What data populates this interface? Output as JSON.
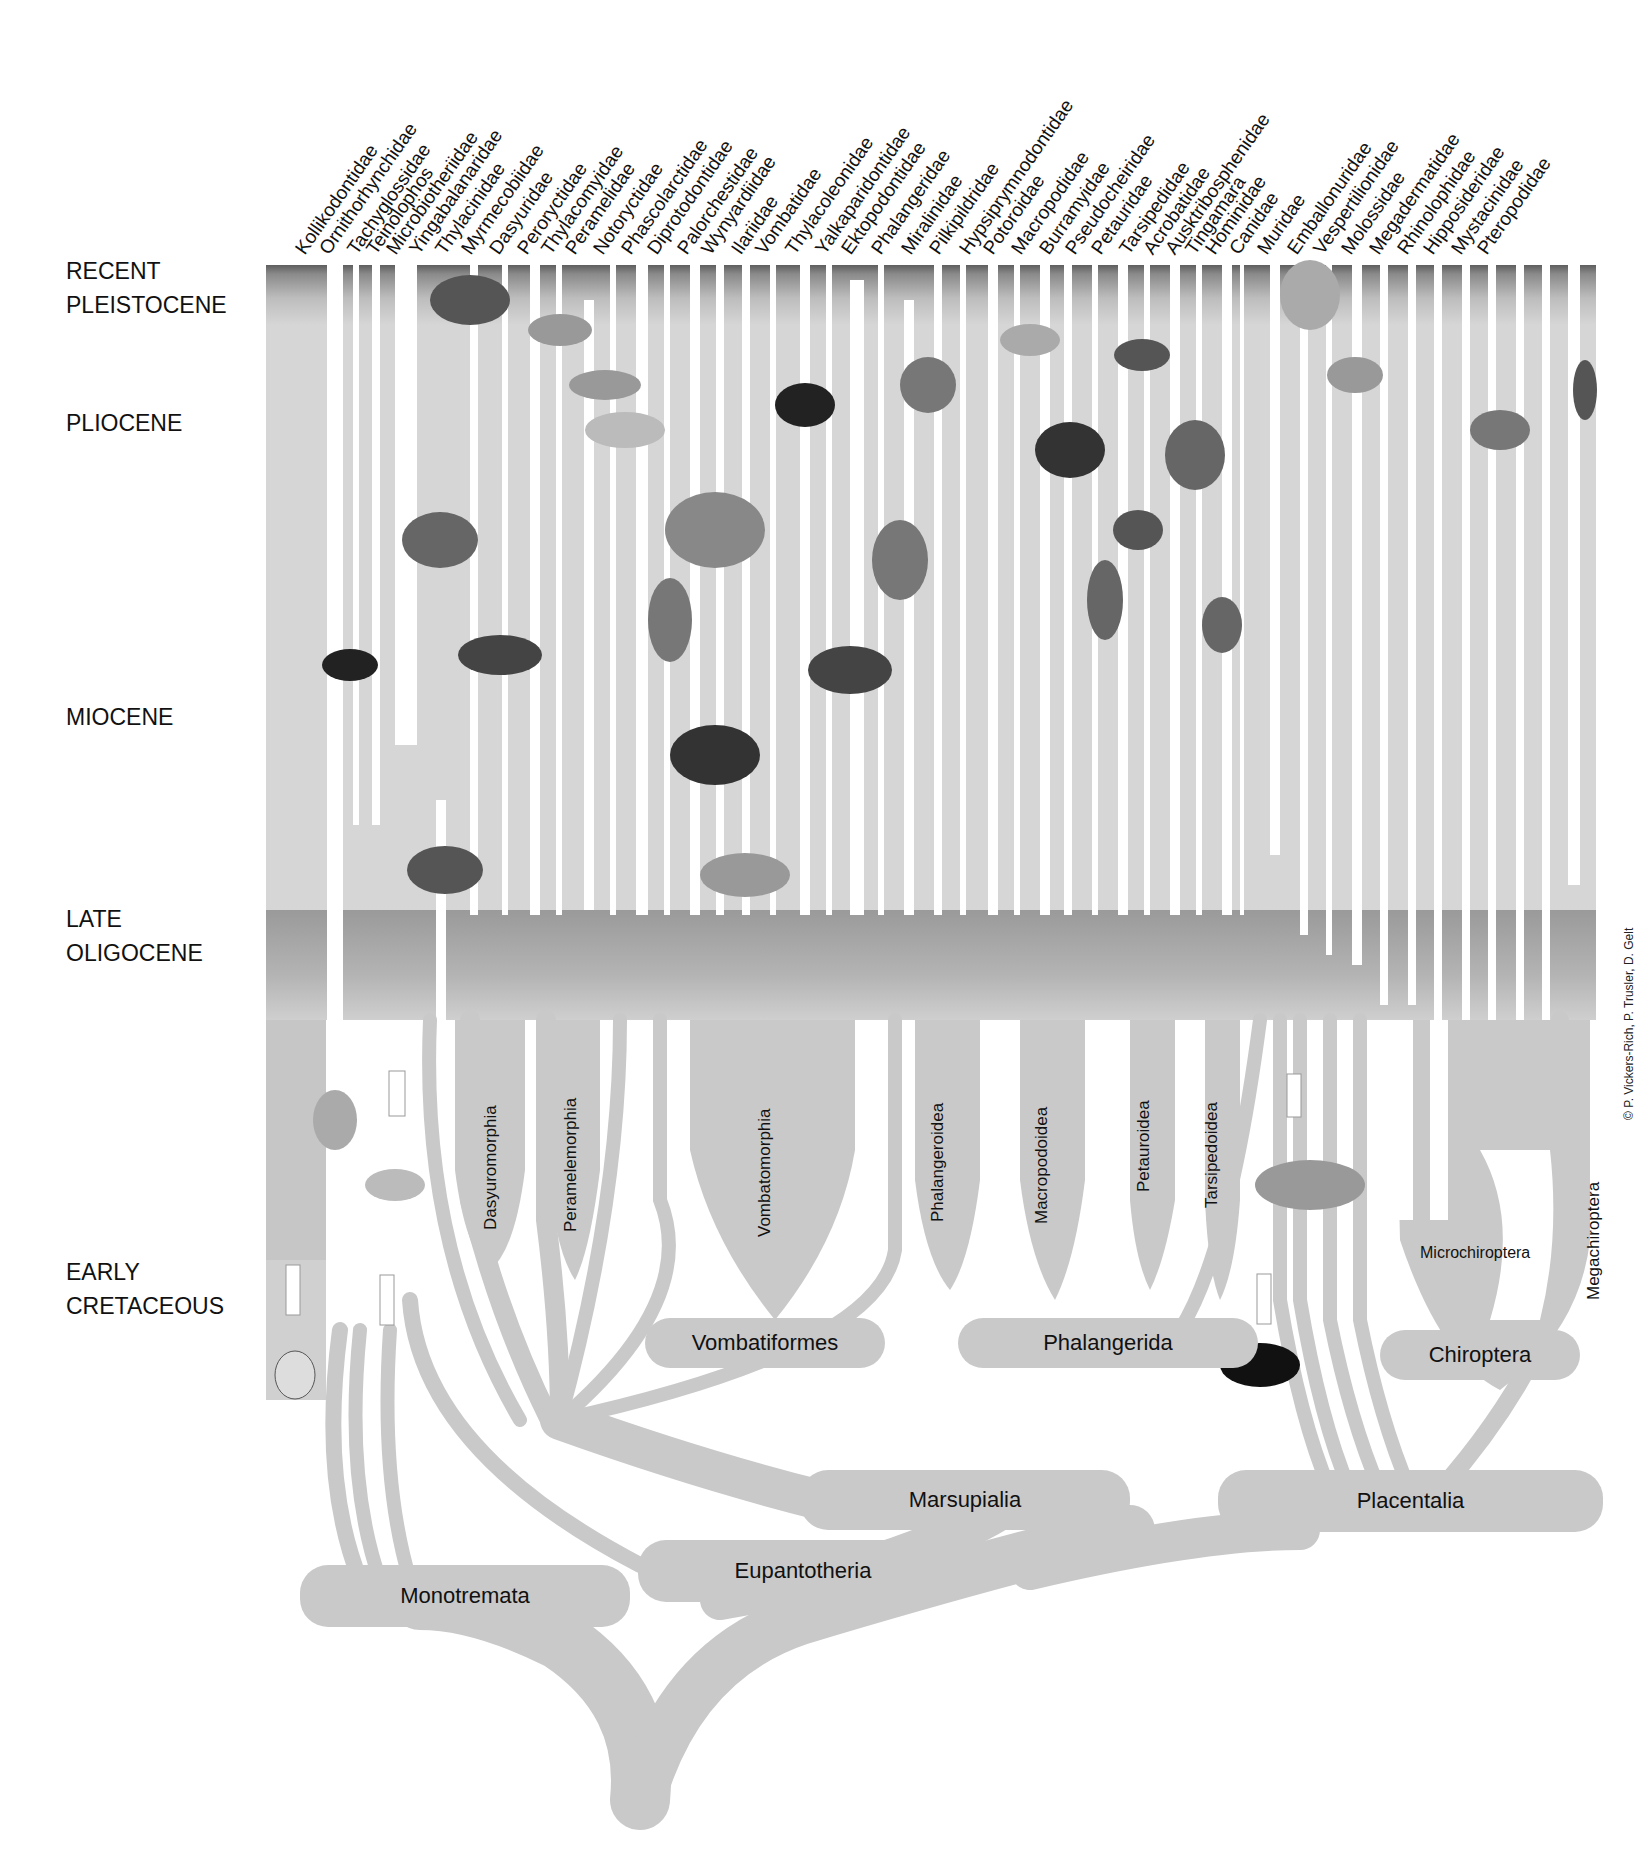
{
  "eras": [
    {
      "label": "RECENT\nPLEISTOCENE",
      "top": 254
    },
    {
      "label": "PLIOCENE",
      "top": 406
    },
    {
      "label": "MIOCENE",
      "top": 700
    },
    {
      "label": "LATE\nOLIGOCENE",
      "top": 902
    },
    {
      "label": "EARLY\nCRETACEOUS",
      "top": 1255
    }
  ],
  "taxa": [
    {
      "name": "Kollikodontidae",
      "x": 316
    },
    {
      "name": "Ornithorhynchidae",
      "x": 340
    },
    {
      "name": "Tachyglossidae",
      "x": 368
    },
    {
      "name": "Teinolophos",
      "x": 387
    },
    {
      "name": "Microbiotheriidae",
      "x": 407
    },
    {
      "name": "Yingabalanaridae",
      "x": 430
    },
    {
      "name": "Thylacinidae",
      "x": 456
    },
    {
      "name": "Myrmecobiidae",
      "x": 482
    },
    {
      "name": "Dasyuridae",
      "x": 510
    },
    {
      "name": "Peroryctidae",
      "x": 538
    },
    {
      "name": "Thylacomyidae",
      "x": 562
    },
    {
      "name": "Peramelidae",
      "x": 586
    },
    {
      "name": "Notoryctidae",
      "x": 614
    },
    {
      "name": "Phascolarctidae",
      "x": 642
    },
    {
      "name": "Diprotodontidae",
      "x": 668
    },
    {
      "name": "Palorchestidae",
      "x": 698
    },
    {
      "name": "Wynyardiidae",
      "x": 722
    },
    {
      "name": "Ilariidae",
      "x": 752
    },
    {
      "name": "Vombatidae",
      "x": 776
    },
    {
      "name": "Thylacoleonidae",
      "x": 806
    },
    {
      "name": "Yalkaparidontidae",
      "x": 836
    },
    {
      "name": "Ektopodontidae",
      "x": 862
    },
    {
      "name": "Phalangeridae",
      "x": 892
    },
    {
      "name": "Miralinidae",
      "x": 922
    },
    {
      "name": "Pilkipildridae",
      "x": 950
    },
    {
      "name": "Hypsiprymnodontidae",
      "x": 980
    },
    {
      "name": "Potoroidae",
      "x": 1004
    },
    {
      "name": "Macropodidae",
      "x": 1032
    },
    {
      "name": "Burramyidae",
      "x": 1060
    },
    {
      "name": "Pseudocheiridae",
      "x": 1086
    },
    {
      "name": "Petauridae",
      "x": 1112
    },
    {
      "name": "Tarsipedidae",
      "x": 1140
    },
    {
      "name": "Acrobatidae",
      "x": 1164
    },
    {
      "name": "Ausktribosphenidae",
      "x": 1186
    },
    {
      "name": "Tingamara",
      "x": 1206
    },
    {
      "name": "Hominidae",
      "x": 1226
    },
    {
      "name": "Canidae",
      "x": 1250
    },
    {
      "name": "Muridae",
      "x": 1278
    },
    {
      "name": "Emballonuridae",
      "x": 1308
    },
    {
      "name": "Vespertilionidae",
      "x": 1334
    },
    {
      "name": "Molossidae",
      "x": 1362
    },
    {
      "name": "Megadermatidae",
      "x": 1390
    },
    {
      "name": "Rhinolophidae",
      "x": 1418
    },
    {
      "name": "Hipposideridae",
      "x": 1444
    },
    {
      "name": "Mystacinidae",
      "x": 1472
    },
    {
      "name": "Pteropodidae",
      "x": 1498
    }
  ],
  "subclades": [
    {
      "name": "Dasyuromorphia",
      "x": 491,
      "y": 1230
    },
    {
      "name": "Peramelemorphia",
      "x": 571,
      "y": 1232
    },
    {
      "name": "Vombatomorphia",
      "x": 765,
      "y": 1237
    },
    {
      "name": "Phalangeroidea",
      "x": 938,
      "y": 1222
    },
    {
      "name": "Macropodoidea",
      "x": 1042,
      "y": 1224
    },
    {
      "name": "Petauroidea",
      "x": 1144,
      "y": 1192
    },
    {
      "name": "Tarsipedoidea",
      "x": 1212,
      "y": 1208
    },
    {
      "name": "Megachiroptera",
      "x": 1594,
      "y": 1300
    }
  ],
  "clades": [
    {
      "name": "Vombatiformes",
      "x": 645,
      "y": 1318,
      "w": 240,
      "h": 50
    },
    {
      "name": "Phalangerida",
      "x": 958,
      "y": 1318,
      "w": 300,
      "h": 50
    },
    {
      "name": "Chiroptera",
      "x": 1380,
      "y": 1330,
      "w": 200,
      "h": 50
    },
    {
      "name": "Marsupialia",
      "x": 800,
      "y": 1470,
      "w": 330,
      "h": 60
    },
    {
      "name": "Placentalia",
      "x": 1218,
      "y": 1470,
      "w": 385,
      "h": 62
    },
    {
      "name": "Eupantotheria",
      "x": 638,
      "y": 1540,
      "w": 330,
      "h": 62
    },
    {
      "name": "Monotremata",
      "x": 300,
      "y": 1565,
      "w": 330,
      "h": 62
    }
  ],
  "microchiroptera_label": "Microchiroptera",
  "credit": "© P. Vickers-Rich, P. Trusler, D. Gelt",
  "colors": {
    "branch_gray": "#c9c9c9",
    "band_dark": "#7a7a7a",
    "band_light": "#d8d8d8",
    "text": "#111111"
  }
}
